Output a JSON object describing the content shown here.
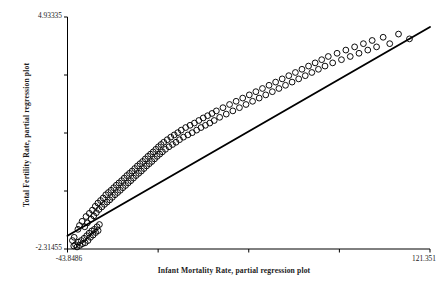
{
  "chart_data": {
    "type": "scatter",
    "title": "",
    "xlabel": "Infant Mortality Rate, partial regression plot",
    "ylabel": "Total Fertility Rate, partial regression plot",
    "xlim": [
      -43.8486,
      121.351
    ],
    "ylim": [
      -2.31455,
      4.93335
    ],
    "xticklabels": [
      "-43.8486",
      "121.351"
    ],
    "yticklabels": [
      "-2.31455",
      "4.93335"
    ],
    "x_tick_count": 5,
    "y_tick_count": 5,
    "grid": false,
    "legend": null,
    "marker": "open-circle",
    "marker_color": "#000000",
    "line_color": "#000000",
    "fit_line": {
      "name": "linear fit",
      "x": [
        -43.8486,
        121.351
      ],
      "y": [
        -1.9,
        4.62
      ]
    },
    "series": [
      {
        "name": "countries",
        "x": [
          -41.0,
          -40.2,
          -39.5,
          -38.9,
          -38.2,
          -37.6,
          -37.0,
          -36.3,
          -35.8,
          -35.1,
          -34.5,
          -34.0,
          -33.4,
          -32.8,
          -32.2,
          -31.6,
          -31.0,
          -30.4,
          -29.9,
          -29.3,
          -41.6,
          -40.8,
          -39.1,
          -38.4,
          -37.2,
          -36.0,
          -35.4,
          -34.8,
          -33.9,
          -33.1,
          -32.5,
          -31.9,
          -31.2,
          -30.7,
          -30.0,
          -29.5,
          -28.8,
          -28.2,
          -27.6,
          -27.0,
          -26.4,
          -25.8,
          -25.2,
          -24.6,
          -24.0,
          -23.4,
          -22.8,
          -22.2,
          -21.6,
          -21.0,
          -20.4,
          -19.8,
          -19.2,
          -18.6,
          -18.0,
          -17.4,
          -16.8,
          -16.2,
          -15.6,
          -15.0,
          -14.4,
          -13.8,
          -13.2,
          -12.6,
          -12.0,
          -11.4,
          -10.8,
          -10.2,
          -9.6,
          -9.0,
          -8.4,
          -7.8,
          -7.2,
          -6.6,
          -6.0,
          -5.4,
          -4.8,
          -4.2,
          -3.6,
          -3.0,
          -2.4,
          -1.8,
          -1.2,
          -0.6,
          0.0,
          0.8,
          1.6,
          2.4,
          3.2,
          4.0,
          4.8,
          5.6,
          6.4,
          7.2,
          8.0,
          9.0,
          10.0,
          11.0,
          12.0,
          13.0,
          14.0,
          15.0,
          16.0,
          17.0,
          18.0,
          19.0,
          20.0,
          21.0,
          22.0,
          23.0,
          24.0,
          25.5,
          27.0,
          28.5,
          30.0,
          31.5,
          33.0,
          34.5,
          36.0,
          37.5,
          39.0,
          40.5,
          42.0,
          43.5,
          45.0,
          46.5,
          48.0,
          49.5,
          51.0,
          52.5,
          54.0,
          55.5,
          57.0,
          58.5,
          60.0,
          61.5,
          63.0,
          64.5,
          66.0,
          67.5,
          69.0,
          70.5,
          72.0,
          73.5,
          75.0,
          77.0,
          79.0,
          81.0,
          83.0,
          85.0,
          87.0,
          89.0,
          91.0,
          93.0,
          95.0,
          97.0,
          100.0,
          103.0,
          107.0,
          112.0
        ],
        "y": [
          -2.22,
          -2.18,
          -2.25,
          -2.1,
          -2.2,
          -2.05,
          -2.15,
          -1.98,
          -2.12,
          -1.9,
          -2.05,
          -1.82,
          -1.95,
          -1.75,
          -1.88,
          -1.7,
          -1.8,
          -1.62,
          -1.74,
          -1.55,
          -2.05,
          -1.95,
          -1.7,
          -1.58,
          -1.45,
          -1.62,
          -1.3,
          -1.5,
          -1.2,
          -1.38,
          -1.1,
          -1.28,
          -0.98,
          -1.18,
          -0.88,
          -1.08,
          -0.8,
          -1.0,
          -0.72,
          -0.92,
          -0.62,
          -0.85,
          -0.55,
          -0.78,
          -0.48,
          -0.7,
          -0.4,
          -0.62,
          -0.32,
          -0.55,
          -0.25,
          -0.48,
          -0.18,
          -0.4,
          -0.1,
          -0.33,
          -0.02,
          -0.25,
          0.05,
          -0.18,
          0.12,
          -0.1,
          0.2,
          -0.02,
          0.28,
          0.05,
          0.35,
          0.12,
          0.42,
          0.2,
          0.5,
          0.28,
          0.58,
          0.35,
          0.65,
          0.42,
          0.72,
          0.5,
          0.8,
          0.58,
          0.88,
          0.65,
          0.95,
          0.72,
          1.02,
          0.8,
          1.1,
          0.88,
          1.18,
          0.95,
          1.25,
          1.02,
          1.32,
          1.1,
          1.4,
          1.18,
          1.48,
          1.25,
          1.55,
          1.32,
          1.62,
          1.4,
          1.7,
          1.48,
          1.78,
          1.55,
          1.85,
          1.62,
          1.92,
          1.7,
          2.0,
          1.8,
          2.1,
          1.9,
          2.2,
          2.0,
          2.3,
          2.1,
          2.4,
          2.2,
          2.5,
          2.3,
          2.6,
          2.4,
          2.7,
          2.5,
          2.8,
          2.6,
          2.9,
          2.7,
          3.0,
          2.8,
          3.1,
          2.9,
          3.2,
          3.0,
          3.3,
          3.1,
          3.4,
          3.2,
          3.5,
          3.3,
          3.6,
          3.4,
          3.7,
          3.5,
          3.8,
          3.6,
          3.9,
          3.7,
          4.0,
          3.8,
          4.1,
          3.9,
          4.2,
          4.0,
          4.3,
          4.1,
          4.4,
          4.25
        ]
      }
    ]
  },
  "axes": {
    "y_title": "Total Fertility Rate, partial regression plot",
    "x_title": "Infant Mortality Rate, partial regression plot",
    "y_max_label": "4.93335",
    "y_min_label": "-2.31455",
    "x_min_label": "-43.8486",
    "x_max_label": "121.351"
  }
}
